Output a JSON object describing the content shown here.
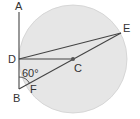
{
  "diagram": {
    "circle": {
      "cx": 73,
      "cy": 59,
      "r": 54,
      "fill": "#e6e6e6",
      "stroke": "#d0d0d0"
    },
    "points": {
      "A": {
        "x": 19,
        "y": 12,
        "label": "A",
        "lx": 16,
        "ly": 11
      },
      "D": {
        "x": 19,
        "y": 59,
        "label": "D",
        "lx": 8,
        "ly": 63
      },
      "B": {
        "x": 19,
        "y": 89,
        "label": "B",
        "lx": 13,
        "ly": 101
      },
      "C": {
        "x": 73,
        "y": 59,
        "label": "C",
        "lx": 73,
        "ly": 72
      },
      "E": {
        "x": 121,
        "y": 33,
        "label": "E",
        "lx": 122,
        "ly": 32
      },
      "F": {
        "x": 32,
        "y": 82,
        "label": "F",
        "lx": 31,
        "ly": 92
      }
    },
    "angle": {
      "label": "60°",
      "lx": 23,
      "ly": 76,
      "vertex": "B"
    },
    "line_color": "#444444"
  }
}
